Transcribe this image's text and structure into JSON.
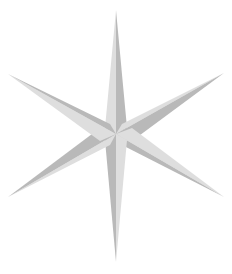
{
  "image": {
    "subject": "six-pointed star",
    "background": "#ffffff",
    "center": [
      116,
      134
    ],
    "colors": {
      "light_facet": "#dedede",
      "dark_facet": "#b9b9b9",
      "mid_facet": "#cccccc"
    },
    "rays": [
      {
        "name": "top",
        "tip": [
          116,
          10
        ],
        "base_left": [
          105,
          128
        ],
        "base_right": [
          127,
          128
        ]
      },
      {
        "name": "upper-right",
        "tip": [
          224,
          73
        ],
        "base_left": [
          122,
          124
        ],
        "base_right": [
          132,
          141
        ]
      },
      {
        "name": "lower-right",
        "tip": [
          224,
          197
        ],
        "base_left": [
          132,
          128
        ],
        "base_right": [
          122,
          145
        ]
      },
      {
        "name": "bottom",
        "tip": [
          116,
          262
        ],
        "base_left": [
          127,
          140
        ],
        "base_right": [
          105,
          140
        ]
      },
      {
        "name": "lower-left",
        "tip": [
          8,
          197
        ],
        "base_left": [
          110,
          145
        ],
        "base_right": [
          100,
          128
        ]
      },
      {
        "name": "upper-left",
        "tip": [
          8,
          74
        ],
        "base_left": [
          100,
          141
        ],
        "base_right": [
          110,
          124
        ]
      }
    ]
  }
}
